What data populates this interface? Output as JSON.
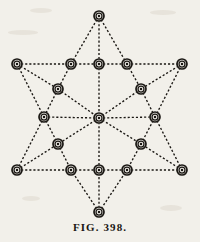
{
  "figure": {
    "caption": "FIG. 398.",
    "plate_background": "#f2f0ea",
    "ink_color": "#1a1713",
    "node_count": 19,
    "edge_style": "dotted"
  },
  "diagram_data": {
    "type": "diagram",
    "title": "FIG. 398.",
    "nodes": [
      {
        "id": "n-top-apex",
        "x": 99,
        "y": 16,
        "label": ""
      },
      {
        "id": "n-left-outer",
        "x": 17,
        "y": 64,
        "label": ""
      },
      {
        "id": "n-upper-left-mid",
        "x": 71,
        "y": 64,
        "label": ""
      },
      {
        "id": "n-upper-center",
        "x": 99,
        "y": 64,
        "label": ""
      },
      {
        "id": "n-upper-right-mid",
        "x": 127,
        "y": 64,
        "label": ""
      },
      {
        "id": "n-right-outer",
        "x": 182,
        "y": 64,
        "label": ""
      },
      {
        "id": "n-inner-upper-left",
        "x": 58,
        "y": 89,
        "label": ""
      },
      {
        "id": "n-inner-upper-right",
        "x": 141,
        "y": 89,
        "label": ""
      },
      {
        "id": "n-left-waist",
        "x": 44,
        "y": 117,
        "label": ""
      },
      {
        "id": "n-center",
        "x": 99,
        "y": 118,
        "label": ""
      },
      {
        "id": "n-right-waist",
        "x": 155,
        "y": 117,
        "label": ""
      },
      {
        "id": "n-inner-lower-left",
        "x": 58,
        "y": 144,
        "label": ""
      },
      {
        "id": "n-inner-lower-right",
        "x": 141,
        "y": 144,
        "label": ""
      },
      {
        "id": "n-left-bottom",
        "x": 17,
        "y": 170,
        "label": ""
      },
      {
        "id": "n-lower-left-mid",
        "x": 71,
        "y": 170,
        "label": ""
      },
      {
        "id": "n-lower-center",
        "x": 99,
        "y": 170,
        "label": ""
      },
      {
        "id": "n-lower-right-mid",
        "x": 127,
        "y": 170,
        "label": ""
      },
      {
        "id": "n-right-bottom",
        "x": 182,
        "y": 170,
        "label": ""
      },
      {
        "id": "n-bottom-apex",
        "x": 99,
        "y": 212,
        "label": ""
      }
    ],
    "edges": [
      [
        "n-top-apex",
        "n-upper-left-mid"
      ],
      [
        "n-top-apex",
        "n-upper-center"
      ],
      [
        "n-top-apex",
        "n-upper-right-mid"
      ],
      [
        "n-left-outer",
        "n-upper-left-mid"
      ],
      [
        "n-upper-left-mid",
        "n-upper-center"
      ],
      [
        "n-upper-center",
        "n-upper-right-mid"
      ],
      [
        "n-upper-right-mid",
        "n-right-outer"
      ],
      [
        "n-left-outer",
        "n-inner-upper-left"
      ],
      [
        "n-left-outer",
        "n-left-waist"
      ],
      [
        "n-upper-left-mid",
        "n-inner-upper-left"
      ],
      [
        "n-inner-upper-left",
        "n-left-waist"
      ],
      [
        "n-inner-upper-left",
        "n-center"
      ],
      [
        "n-upper-center",
        "n-center"
      ],
      [
        "n-inner-upper-right",
        "n-center"
      ],
      [
        "n-upper-right-mid",
        "n-inner-upper-right"
      ],
      [
        "n-right-outer",
        "n-inner-upper-right"
      ],
      [
        "n-right-outer",
        "n-right-waist"
      ],
      [
        "n-inner-upper-right",
        "n-right-waist"
      ],
      [
        "n-left-waist",
        "n-center"
      ],
      [
        "n-center",
        "n-right-waist"
      ],
      [
        "n-left-waist",
        "n-inner-lower-left"
      ],
      [
        "n-right-waist",
        "n-inner-lower-right"
      ],
      [
        "n-center",
        "n-inner-lower-left"
      ],
      [
        "n-center",
        "n-inner-lower-right"
      ],
      [
        "n-center",
        "n-lower-center"
      ],
      [
        "n-left-bottom",
        "n-inner-lower-left"
      ],
      [
        "n-left-bottom",
        "n-left-waist"
      ],
      [
        "n-inner-lower-left",
        "n-lower-left-mid"
      ],
      [
        "n-inner-lower-right",
        "n-lower-right-mid"
      ],
      [
        "n-right-bottom",
        "n-inner-lower-right"
      ],
      [
        "n-right-bottom",
        "n-right-waist"
      ],
      [
        "n-left-bottom",
        "n-lower-left-mid"
      ],
      [
        "n-lower-left-mid",
        "n-lower-center"
      ],
      [
        "n-lower-center",
        "n-lower-right-mid"
      ],
      [
        "n-lower-right-mid",
        "n-right-bottom"
      ],
      [
        "n-bottom-apex",
        "n-lower-left-mid"
      ],
      [
        "n-bottom-apex",
        "n-lower-center"
      ],
      [
        "n-bottom-apex",
        "n-lower-right-mid"
      ]
    ]
  }
}
